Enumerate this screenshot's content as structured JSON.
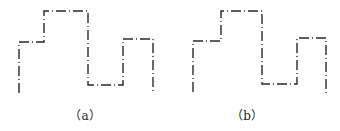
{
  "diagram": {
    "line_color": "#2a2a2a",
    "line_style": "dash-dot",
    "panels": [
      {
        "id": "a",
        "label": "（a）",
        "label_center_x": 85,
        "points": [
          [
            19,
            93
          ],
          [
            19,
            42
          ],
          [
            44,
            42
          ],
          [
            44,
            11
          ],
          [
            88,
            11
          ],
          [
            88,
            85
          ],
          [
            123,
            85
          ],
          [
            123,
            39
          ],
          [
            153,
            39
          ],
          [
            153,
            93
          ]
        ]
      },
      {
        "id": "b",
        "label": "（b）",
        "label_center_x": 247,
        "points": [
          [
            193,
            92
          ],
          [
            193,
            41
          ],
          [
            221,
            41
          ],
          [
            221,
            11
          ],
          [
            262,
            11
          ],
          [
            262,
            84
          ],
          [
            297,
            84
          ],
          [
            297,
            38
          ],
          [
            326,
            38
          ],
          [
            326,
            93
          ]
        ]
      }
    ]
  }
}
